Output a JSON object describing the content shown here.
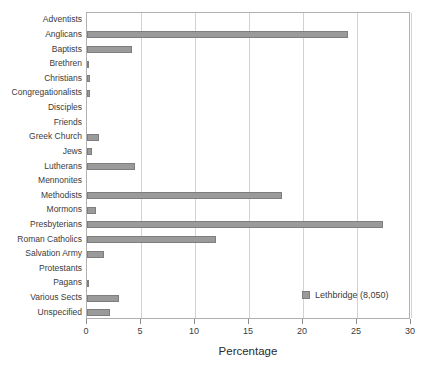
{
  "chart_data": {
    "type": "bar",
    "orientation": "horizontal",
    "title": "",
    "xlabel": "Percentage",
    "ylabel": "",
    "xlim": [
      0,
      30
    ],
    "xticks": [
      0,
      5,
      10,
      15,
      20,
      25,
      30
    ],
    "grid": true,
    "legend": {
      "position": "inside-right",
      "entries": [
        {
          "name": "Lethbridge (8,050)",
          "color": "#9a9a9a"
        }
      ]
    },
    "series": [
      {
        "name": "Lethbridge (8,050)",
        "color": "#9a9a9a",
        "values": [
          0.0,
          24.2,
          4.15,
          0.2,
          0.3,
          0.25,
          0.0,
          0.0,
          1.15,
          0.5,
          4.4,
          0.0,
          18.1,
          0.85,
          27.4,
          11.9,
          1.6,
          0.0,
          0.15,
          3.0,
          2.1
        ]
      }
    ],
    "categories": [
      "Adventists",
      "Anglicans",
      "Baptists",
      "Brethren",
      "Christians",
      "Congregationalists",
      "Disciples",
      "Friends",
      "Greek Church",
      "Jews",
      "Lutherans",
      "Mennonites",
      "Methodists",
      "Mormons",
      "Presbyterians",
      "Roman Catholics",
      "Salvation Army",
      "Protestants",
      "Pagans",
      "Various Sects",
      "Unspecified"
    ]
  },
  "colors": {
    "bar_fill": "#9a9a9a",
    "bar_border": "#7e7e7e",
    "grid": "#d2d2d2",
    "frame": "#b0b0b0",
    "text": "#3b3b3b"
  }
}
